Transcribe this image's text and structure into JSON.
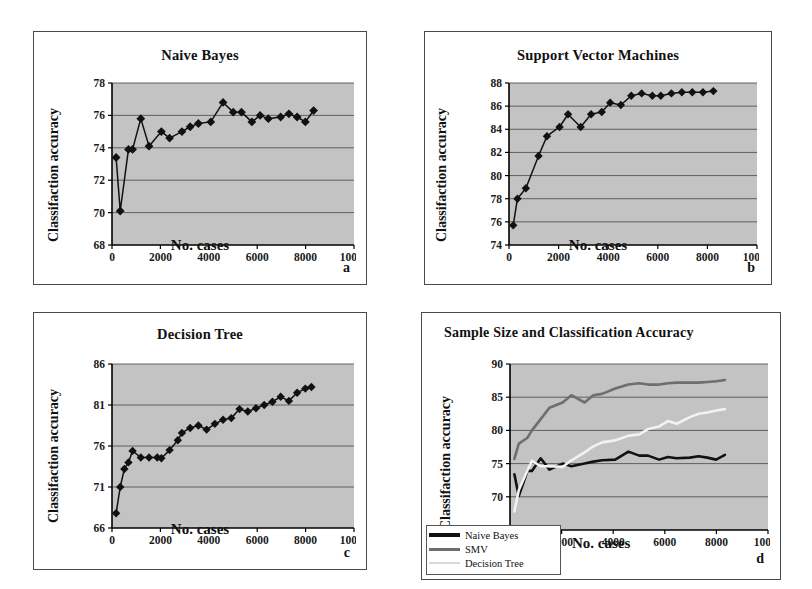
{
  "figure": {
    "panels": [
      {
        "letter": "a",
        "title": "Naive Bayes",
        "xlabel": "No. cases",
        "ylabel": "Classifaction accuracy"
      },
      {
        "letter": "b",
        "title": "Support Vector Machines",
        "xlabel": "No. cases",
        "ylabel": "Classifaction accuracy"
      },
      {
        "letter": "c",
        "title": "Decision Tree",
        "xlabel": "No. cases",
        "ylabel": "Classifaction accuracy"
      },
      {
        "letter": "d",
        "title": "Sample Size and Classification Accuracy",
        "xlabel": "No. cases",
        "ylabel": "Classifaction accuracy"
      }
    ]
  },
  "colors": {
    "plot_background": "#c3c3c3",
    "axis": "#000000",
    "gridline": "#555555",
    "series_naive_bayes": "#111111",
    "series_svm": "#6e6e6e",
    "series_decision_tree": "#f2f2f2"
  },
  "legend": {
    "position": "bottom-left",
    "items": [
      {
        "label": "Naive Bayes",
        "color": "#111111"
      },
      {
        "label": "SMV",
        "color": "#6e6e6e"
      },
      {
        "label": "Decision Tree",
        "color": "#f2f2f2"
      }
    ]
  },
  "chart_data": [
    {
      "id": "a",
      "type": "line",
      "title": "Naive Bayes",
      "xlabel": "No. cases",
      "ylabel": "Classifaction accuracy",
      "marker": "diamond",
      "grid": true,
      "xlim": [
        0,
        10000
      ],
      "ylim": [
        68,
        78
      ],
      "xticks": [
        0,
        2000,
        4000,
        6000,
        8000,
        10000
      ],
      "yticks": [
        68,
        70,
        72,
        74,
        76,
        78
      ],
      "x": [
        170,
        340,
        680,
        850,
        1190,
        1530,
        2040,
        2380,
        2890,
        3230,
        3570,
        4080,
        4590,
        5010,
        5350,
        5780,
        6120,
        6460,
        6970,
        7310,
        7650,
        7990,
        8330
      ],
      "values": [
        73.4,
        70.1,
        73.9,
        73.9,
        75.8,
        74.1,
        75.0,
        74.6,
        75.0,
        75.3,
        75.5,
        75.6,
        76.8,
        76.2,
        76.2,
        75.6,
        76.0,
        75.8,
        75.9,
        76.1,
        75.9,
        75.6,
        76.3
      ]
    },
    {
      "id": "b",
      "type": "line",
      "title": "Support Vector Machines",
      "xlabel": "No. cases",
      "ylabel": "Classifaction accuracy",
      "marker": "diamond",
      "grid": true,
      "xlim": [
        0,
        10000
      ],
      "ylim": [
        74,
        88
      ],
      "xticks": [
        0,
        2000,
        4000,
        6000,
        8000,
        10000
      ],
      "yticks": [
        74,
        76,
        78,
        80,
        82,
        84,
        86,
        88
      ],
      "x": [
        170,
        340,
        680,
        1190,
        1530,
        2040,
        2380,
        2890,
        3310,
        3740,
        4080,
        4510,
        4930,
        5350,
        5780,
        6120,
        6550,
        6970,
        7390,
        7820,
        8240
      ],
      "values": [
        75.7,
        78.0,
        78.9,
        81.7,
        83.4,
        84.2,
        85.3,
        84.2,
        85.3,
        85.5,
        86.3,
        86.1,
        86.9,
        87.1,
        86.9,
        86.9,
        87.1,
        87.2,
        87.2,
        87.2,
        87.3,
        87.5
      ]
    },
    {
      "id": "c",
      "type": "line",
      "title": "Decision Tree",
      "xlabel": "No. cases",
      "ylabel": "Classifaction accuracy",
      "marker": "diamond",
      "grid": true,
      "xlim": [
        0,
        10000
      ],
      "ylim": [
        66,
        86
      ],
      "xticks": [
        0,
        2000,
        4000,
        6000,
        8000,
        10000
      ],
      "yticks": [
        66,
        71,
        76,
        81,
        86
      ],
      "x": [
        170,
        340,
        510,
        680,
        850,
        1190,
        1530,
        1870,
        2040,
        2380,
        2720,
        2890,
        3230,
        3570,
        3910,
        4250,
        4590,
        4930,
        5270,
        5610,
        5950,
        6290,
        6630,
        6970,
        7310,
        7650,
        7990,
        8240
      ],
      "values": [
        67.8,
        71.0,
        73.2,
        74.0,
        75.4,
        74.6,
        74.6,
        74.6,
        74.5,
        75.5,
        76.7,
        77.6,
        78.2,
        78.5,
        78.0,
        78.7,
        79.2,
        79.4,
        80.5,
        80.2,
        80.6,
        81.0,
        81.4,
        82.0,
        81.5,
        82.5,
        83.0,
        83.2
      ]
    },
    {
      "id": "d",
      "type": "line",
      "title": "Sample Size and Classification Accuracy",
      "xlabel": "No. cases",
      "ylabel": "Classifaction accuracy",
      "marker": "none",
      "grid": true,
      "xlim": [
        0,
        10000
      ],
      "ylim": [
        65,
        90
      ],
      "xticks": [
        0,
        2000,
        4000,
        6000,
        8000,
        10000
      ],
      "yticks": [
        65,
        70,
        75,
        80,
        85,
        90
      ],
      "x": [
        170,
        340,
        680,
        850,
        1190,
        1530,
        2040,
        2380,
        2890,
        3230,
        3570,
        4080,
        4590,
        5010,
        5350,
        5780,
        6120,
        6460,
        6970,
        7310,
        7650,
        7990,
        8330
      ],
      "series": [
        {
          "name": "Naive Bayes",
          "color": "#111111",
          "values": [
            73.4,
            70.1,
            73.9,
            73.9,
            75.8,
            74.1,
            75.0,
            74.6,
            75.0,
            75.3,
            75.5,
            75.6,
            76.8,
            76.2,
            76.2,
            75.6,
            76.0,
            75.8,
            75.9,
            76.1,
            75.9,
            75.6,
            76.3
          ]
        },
        {
          "name": "SMV",
          "color": "#6e6e6e",
          "values": [
            75.7,
            78.0,
            78.9,
            80.0,
            81.7,
            83.4,
            84.2,
            85.3,
            84.2,
            85.3,
            85.5,
            86.3,
            86.9,
            87.1,
            86.9,
            86.9,
            87.1,
            87.2,
            87.2,
            87.2,
            87.3,
            87.4,
            87.6
          ]
        },
        {
          "name": "Decision Tree",
          "color": "#f2f2f2",
          "values": [
            67.8,
            71.0,
            74.0,
            75.4,
            74.6,
            74.6,
            74.5,
            75.5,
            76.7,
            77.6,
            78.2,
            78.5,
            79.2,
            79.4,
            80.2,
            80.6,
            81.4,
            81.0,
            82.0,
            82.5,
            82.7,
            83.0,
            83.2
          ]
        }
      ]
    }
  ]
}
